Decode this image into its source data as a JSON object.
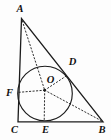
{
  "figure": {
    "background_color": "#fdfdfd",
    "line_color": "#1c1c1c",
    "labels": {
      "A": "A",
      "B": "B",
      "C": "C",
      "D": "D",
      "E": "E",
      "F": "F",
      "O": "O"
    }
  }
}
